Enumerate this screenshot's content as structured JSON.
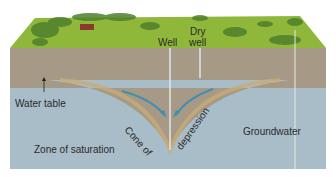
{
  "diagram": {
    "labels": {
      "well": "Well",
      "dry_well_line1": "Dry",
      "dry_well_line2": "well",
      "water_table": "Water table",
      "cone_part1": "Cone of",
      "cone_part2": "depression",
      "groundwater": "Groundwater",
      "zone_of_saturation": "Zone of saturation"
    },
    "colors": {
      "grass": "#8fb83a",
      "grass_dark": "#4f7f2c",
      "soil": "#a69a86",
      "soil_cone": "#c2a77a",
      "saturated": "#a9bdc8",
      "arrow": "#3f8fb0",
      "house": "#8a3a2a",
      "background": "#ffffff"
    }
  }
}
